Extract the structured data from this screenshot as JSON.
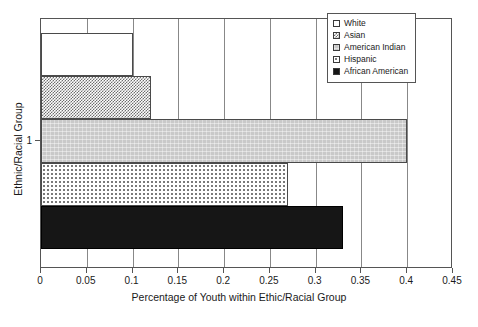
{
  "chart_data": {
    "type": "bar",
    "orientation": "horizontal",
    "title": "",
    "xlabel": "Percentage of Youth within Ethic/Racial Group",
    "ylabel": "Ethnic/Racial Group",
    "xlim": [
      0,
      0.45
    ],
    "ylim": [
      0,
      1
    ],
    "grid": true,
    "grid_axis": "x",
    "legend_position": "top-right",
    "categories": [
      "1"
    ],
    "ytick_labels": [
      "1"
    ],
    "xtick_labels": [
      "0",
      "0.05",
      "0.1",
      "0.15",
      "0.2",
      "0.25",
      "0.3",
      "0.35",
      "0.4",
      "0.45"
    ],
    "xtick_values": [
      0,
      0.05,
      0.1,
      0.15,
      0.2,
      0.25,
      0.3,
      0.35,
      0.4,
      0.45
    ],
    "series": [
      {
        "name": "White",
        "values": [
          0.1
        ],
        "fill": "white",
        "swatch_color": "#ffffff"
      },
      {
        "name": "Asian",
        "values": [
          0.12
        ],
        "fill": "dense-checker",
        "swatch_color": "#6e6e6e"
      },
      {
        "name": "American Indian",
        "values": [
          0.4
        ],
        "fill": "solid-gray",
        "swatch_color": "#c9c9c9"
      },
      {
        "name": "Hispanic",
        "values": [
          0.27
        ],
        "fill": "light-dots",
        "swatch_color": "#ededed"
      },
      {
        "name": "African American",
        "values": [
          0.33
        ],
        "fill": "solid-black",
        "swatch_color": "#161616"
      }
    ]
  },
  "legend": {
    "items": [
      {
        "label": "White"
      },
      {
        "label": "Asian"
      },
      {
        "label": "American Indian"
      },
      {
        "label": "Hispanic"
      },
      {
        "label": "African American"
      }
    ]
  },
  "axes": {
    "x_title": "Percentage of Youth within Ethic/Racial Group",
    "y_title": "Ethnic/Racial Group",
    "x_ticks": [
      "0",
      "0.05",
      "0.1",
      "0.15",
      "0.2",
      "0.25",
      "0.3",
      "0.35",
      "0.4",
      "0.45"
    ],
    "y_ticks": [
      "1"
    ]
  }
}
